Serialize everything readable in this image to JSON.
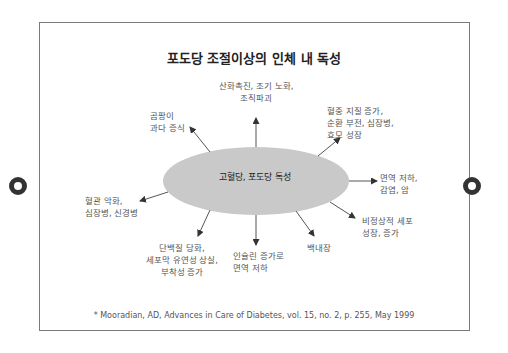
{
  "diagram": {
    "title": "포도당 조절이상의 인체 내 독성",
    "center": "고혈당, 포도당 독성",
    "colors": {
      "ellipse": "#c9c9c9",
      "arrow": "#555555",
      "text": "#555555",
      "frame": "#7a7a7a",
      "binder_hole": "#333333"
    },
    "effects": [
      {
        "id": "top",
        "lines": [
          "산화촉진, 조기 노화,",
          "조직파괴"
        ]
      },
      {
        "id": "top-right",
        "lines": [
          "혈중 지질 증가,",
          "순환 부전, 심장병,",
          "효모 성장"
        ]
      },
      {
        "id": "top-left",
        "lines": [
          "곰팡이",
          "과다 증식"
        ]
      },
      {
        "id": "right",
        "lines": [
          "면역 저하,",
          "감염, 암"
        ]
      },
      {
        "id": "lower-right",
        "lines": [
          "비정상적 세포",
          "성장, 증가"
        ]
      },
      {
        "id": "left",
        "lines": [
          "혈관 악화,",
          "심장병, 신경병"
        ]
      },
      {
        "id": "bottom-left",
        "lines": [
          "단백질 당화,",
          "세포막 유연성 상실,",
          "부착성 증가"
        ]
      },
      {
        "id": "bottom",
        "lines": [
          "인슐린 증가로",
          "면역 저하"
        ]
      },
      {
        "id": "bottom-right",
        "lines": [
          "백내장"
        ]
      }
    ],
    "citation": "* Mooradian, AD, Advances in Care of Diabetes, vol. 15, no. 2, p. 255, May 1999"
  }
}
